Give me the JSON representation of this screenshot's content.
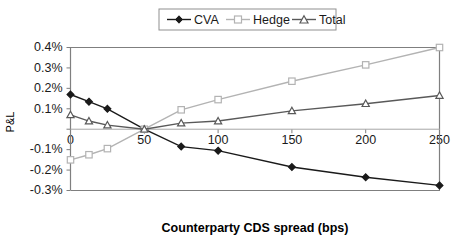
{
  "chart_data": {
    "type": "line",
    "title": "",
    "xlabel": "Counterparty CDS spread (bps)",
    "ylabel": "P&L",
    "xlim": [
      0,
      250
    ],
    "ylim": [
      -0.3,
      0.4
    ],
    "grid": false,
    "legend_position": "top-center",
    "x": [
      0,
      12.5,
      25,
      50,
      75,
      100,
      150,
      200,
      250
    ],
    "xticks": [
      0,
      50,
      100,
      150,
      200,
      250
    ],
    "xtick_labels": [
      "0",
      "50",
      "100",
      "150",
      "200",
      "250"
    ],
    "yticks": [
      0.4,
      0.3,
      0.2,
      0.1,
      0.0,
      -0.1,
      -0.2,
      -0.3
    ],
    "ytick_labels": [
      "0.4%",
      "0.3%",
      "0.2%",
      "0.1%",
      "",
      "-0.1%",
      "-0.2%",
      "-0.3%"
    ],
    "series": [
      {
        "name": "CVA",
        "color": "#1a1a1a",
        "marker": "diamond",
        "values": [
          0.17,
          0.135,
          0.1,
          0.0,
          -0.085,
          -0.105,
          -0.185,
          -0.235,
          -0.275
        ]
      },
      {
        "name": "Hedge",
        "color": "#b3b3b3",
        "marker": "square",
        "values": [
          -0.15,
          -0.125,
          -0.095,
          0.0,
          0.095,
          0.145,
          0.235,
          0.315,
          0.4
        ]
      },
      {
        "name": "Total",
        "color": "#595959",
        "marker": "triangle",
        "values": [
          0.07,
          0.04,
          0.02,
          0.0,
          0.03,
          0.04,
          0.09,
          0.125,
          0.165
        ]
      }
    ]
  },
  "legend": {
    "entries": [
      {
        "label": "CVA"
      },
      {
        "label": "Hedge"
      },
      {
        "label": "Total"
      }
    ]
  },
  "axes": {
    "x_title": "Counterparty CDS spread (bps)",
    "y_title": "P&L"
  }
}
